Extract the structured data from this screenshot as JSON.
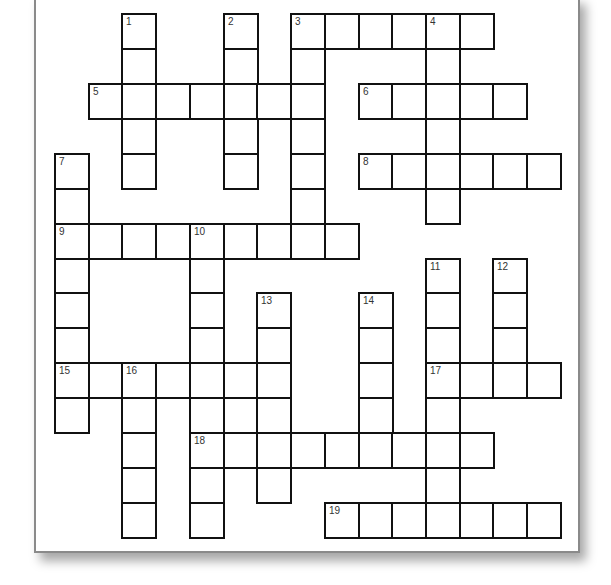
{
  "puzzle": {
    "type": "crossword",
    "grid": {
      "cols": 15,
      "rows": 15
    },
    "colors": {
      "paper": "#ffffff",
      "cell_border": "#111111",
      "paper_border": "#8a8a8a",
      "number_text": "#333333"
    },
    "clues": {
      "across": [
        {
          "number": "3",
          "row": 0,
          "col": 7,
          "length": 6
        },
        {
          "number": "5",
          "row": 2,
          "col": 1,
          "length": 7
        },
        {
          "number": "6",
          "row": 2,
          "col": 9,
          "length": 5
        },
        {
          "number": "8",
          "row": 4,
          "col": 9,
          "length": 6
        },
        {
          "number": "9",
          "row": 6,
          "col": 0,
          "length": 9
        },
        {
          "number": "15",
          "row": 10,
          "col": 0,
          "length": 7
        },
        {
          "number": "17",
          "row": 10,
          "col": 11,
          "length": 4
        },
        {
          "number": "18",
          "row": 12,
          "col": 4,
          "length": 9
        },
        {
          "number": "19",
          "row": 14,
          "col": 8,
          "length": 7
        }
      ],
      "down": [
        {
          "number": "1",
          "row": 0,
          "col": 2,
          "length": 5
        },
        {
          "number": "2",
          "row": 0,
          "col": 5,
          "length": 5
        },
        {
          "number": "3",
          "row": 0,
          "col": 7,
          "length": 7
        },
        {
          "number": "4",
          "row": 0,
          "col": 11,
          "length": 6
        },
        {
          "number": "7",
          "row": 4,
          "col": 0,
          "length": 8
        },
        {
          "number": "10",
          "row": 6,
          "col": 4,
          "length": 9
        },
        {
          "number": "11",
          "row": 7,
          "col": 11,
          "length": 8
        },
        {
          "number": "12",
          "row": 7,
          "col": 13,
          "length": 4
        },
        {
          "number": "13",
          "row": 8,
          "col": 6,
          "length": 6
        },
        {
          "number": "14",
          "row": 8,
          "col": 9,
          "length": 5
        },
        {
          "number": "16",
          "row": 10,
          "col": 2,
          "length": 5
        }
      ]
    },
    "numbers": [
      {
        "label": "1",
        "row": 0,
        "col": 2
      },
      {
        "label": "2",
        "row": 0,
        "col": 5
      },
      {
        "label": "3",
        "row": 0,
        "col": 7
      },
      {
        "label": "4",
        "row": 0,
        "col": 11
      },
      {
        "label": "5",
        "row": 2,
        "col": 1
      },
      {
        "label": "6",
        "row": 2,
        "col": 9
      },
      {
        "label": "7",
        "row": 4,
        "col": 0
      },
      {
        "label": "8",
        "row": 4,
        "col": 9
      },
      {
        "label": "9",
        "row": 6,
        "col": 0
      },
      {
        "label": "10",
        "row": 6,
        "col": 4
      },
      {
        "label": "11",
        "row": 7,
        "col": 11
      },
      {
        "label": "12",
        "row": 7,
        "col": 13
      },
      {
        "label": "13",
        "row": 8,
        "col": 6
      },
      {
        "label": "14",
        "row": 8,
        "col": 9
      },
      {
        "label": "15",
        "row": 10,
        "col": 0
      },
      {
        "label": "16",
        "row": 10,
        "col": 2
      },
      {
        "label": "17",
        "row": 10,
        "col": 11
      },
      {
        "label": "18",
        "row": 12,
        "col": 4
      },
      {
        "label": "19",
        "row": 14,
        "col": 8
      }
    ]
  }
}
